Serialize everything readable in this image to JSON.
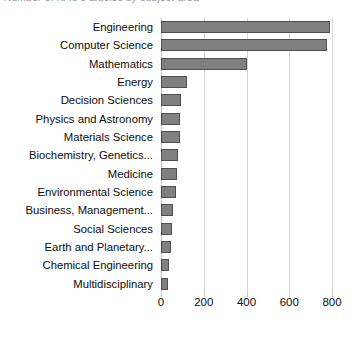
{
  "chart": {
    "title": "Number of KAU's articles by subject area",
    "title_visible_fragment": "...of KAU's articles by subject area",
    "bar_color": "#808080",
    "bar_border_color": "#4f4f4f",
    "grid_color": "#d6d6d6"
  },
  "chart_data": {
    "type": "bar",
    "orientation": "horizontal",
    "title": "Number of KAU's articles by subject area",
    "xlabel": "",
    "ylabel": "",
    "xlim": [
      0,
      800
    ],
    "xticks": [
      0,
      200,
      400,
      600,
      800
    ],
    "xtick_labels": [
      "0",
      "200",
      "400",
      "600",
      "800"
    ],
    "grid": true,
    "grid_axis": "x",
    "legend": false,
    "categories": [
      "Engineering",
      "Computer Science",
      "Mathematics",
      "Energy",
      "Decision Sciences",
      "Physics and Astronomy",
      "Materials Science",
      "Biochemistry, Genetics...",
      "Medicine",
      "Environmental Science",
      "Business, Management...",
      "Social Sciences",
      "Earth and Planetary...",
      "Chemical Engineering",
      "Multidisciplinary"
    ],
    "values": [
      790,
      775,
      400,
      120,
      95,
      90,
      88,
      80,
      75,
      70,
      58,
      50,
      45,
      38,
      32
    ]
  }
}
